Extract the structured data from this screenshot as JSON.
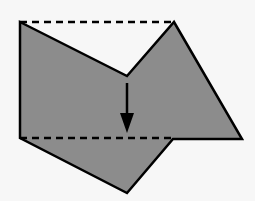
{
  "diagram": {
    "colors": {
      "background": "#f7f7f7",
      "fill": "#8c8c8c",
      "stroke": "#000000"
    },
    "shape_points": "20,22 127,76 174,22 242,139 173,139 127,193 20,138",
    "top_dashed_line": {
      "x1": 20,
      "y1": 22,
      "x2": 174,
      "y2": 22
    },
    "bottom_dashed_line": {
      "x1": 20,
      "y1": 138,
      "x2": 173,
      "y2": 138
    },
    "arrow": {
      "x": 127,
      "y1": 83,
      "y2": 133,
      "direction": "down"
    }
  }
}
